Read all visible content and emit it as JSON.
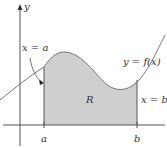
{
  "figure": {
    "axis_labels": {
      "y": "y"
    },
    "annotations": {
      "left_bound": "x = a",
      "right_bound": "x = b",
      "curve": "y = f(x)",
      "region": "R"
    },
    "ticks": {
      "a": "a",
      "b": "b"
    },
    "colors": {
      "region_fill": "#cfcfcf",
      "stroke": "#555555"
    }
  }
}
